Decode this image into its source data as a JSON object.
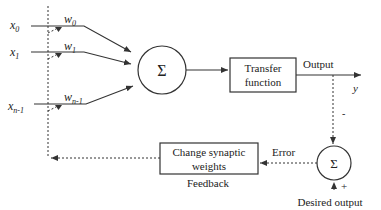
{
  "diagram": {
    "inputs": [
      {
        "label": "x",
        "sub": "0",
        "weight": "w",
        "weight_sub": "0"
      },
      {
        "label": "x",
        "sub": "1",
        "weight": "w",
        "weight_sub": "1"
      },
      {
        "label": "x",
        "sub": "n-1",
        "weight": "w",
        "weight_sub": "n-1"
      }
    ],
    "summation_symbol": "Σ",
    "transfer_box": {
      "line1": "Transfer",
      "line2": "function"
    },
    "output_label": "Output",
    "output_var": "y",
    "error_sum_symbol": "Σ",
    "minus_sign": "-",
    "plus_sign": "+",
    "error_label": "Error",
    "desired_output_label": "Desired output",
    "weights_box": {
      "line1": "Change synaptic",
      "line2": "weights"
    },
    "feedback_label": "Feedback",
    "colors": {
      "stroke": "#333333",
      "text": "#222222",
      "background": "#ffffff"
    }
  }
}
